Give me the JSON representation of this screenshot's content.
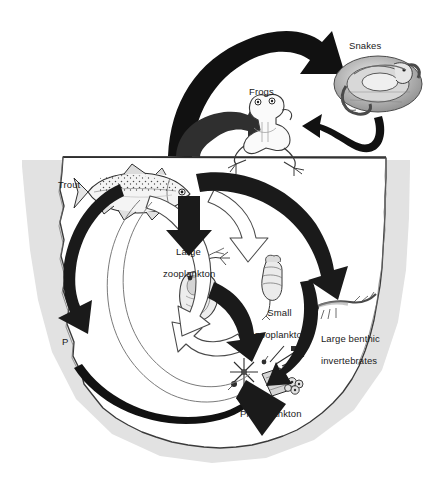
{
  "figure": {
    "type": "food-web-diagram",
    "background_color": "#ffffff",
    "ink_color": "#1a1a1a"
  },
  "regions": {
    "above_water": {
      "name": "terrestrial / above-water zone",
      "description": "open white area above the lake outline"
    },
    "water_body": {
      "name": "lake",
      "description": "irregular rounded basin with a straight waterline at the top",
      "fill": "#ffffff",
      "stroke": "#2b2b2b",
      "shadow": "#dcdcdc"
    }
  },
  "organisms": [
    {
      "id": "snakes",
      "label": "Snakes",
      "label_lines": [
        "Snakes"
      ],
      "zone": "above_water",
      "icon": "snake-coiled-icon",
      "x": 380,
      "y": 95,
      "label_x": 349,
      "label_y": 40
    },
    {
      "id": "frogs",
      "label": "Frogs",
      "label_lines": [
        "Frogs"
      ],
      "zone": "above_water",
      "icon": "frog-icon",
      "x": 268,
      "y": 117,
      "label_x": 249,
      "label_y": 86
    },
    {
      "id": "trout",
      "label": "Trout",
      "label_lines": [
        "Trout"
      ],
      "zone": "water_body",
      "icon": "trout-fish-icon",
      "x": 137,
      "y": 188,
      "label_x": 58,
      "label_y": 179
    },
    {
      "id": "large_zoo",
      "label": "Large zooplankton",
      "label_lines": [
        "Large",
        "zooplankton"
      ],
      "zone": "water_body",
      "icon": "daphnia-icon",
      "x": 196,
      "y": 288,
      "label_x": 182,
      "label_y": 235
    },
    {
      "id": "small_zoo",
      "label": "Small zooplankton",
      "label_lines": [
        "Small",
        "zooplankton"
      ],
      "zone": "water_body",
      "icon": "rotifer-icon",
      "x": 270,
      "y": 279,
      "label_x": 272,
      "label_y": 296
    },
    {
      "id": "benthic",
      "label": "Large benthic invertebrates",
      "label_lines": [
        "Large benthic",
        "invertebrates"
      ],
      "zone": "water_body",
      "icon": "benthic-larva-icon",
      "x": 334,
      "y": 306,
      "label_x": 313,
      "label_y": 322
    },
    {
      "id": "phytoplankton",
      "label": "Phytoplankton",
      "label_lines": [
        "Phytoplankton"
      ],
      "zone": "water_body",
      "icon": "phytoplankton-icon",
      "x": 268,
      "y": 383,
      "label_x": 240,
      "label_y": 408
    },
    {
      "id": "phosphorus",
      "label": "P",
      "label_lines": [
        "P"
      ],
      "zone": "water_body",
      "icon": "nutrient-label",
      "x": 66,
      "y": 340,
      "label_x": 63,
      "label_y": 336
    }
  ],
  "arrows": [
    {
      "id": "trout-to-snakes",
      "from": "trout",
      "to": "snakes",
      "style": "thick-black-curve",
      "color": "#111111"
    },
    {
      "id": "water-to-frogs",
      "from": "water_body",
      "to": "frogs",
      "style": "thick-dark-curve",
      "color": "#2e2e2e"
    },
    {
      "id": "snakes-to-frogs",
      "from": "snakes",
      "to": "frogs",
      "style": "medium-black-curve",
      "color": "#111111"
    },
    {
      "id": "trout-to-large-zoo",
      "from": "trout",
      "to": "large_zoo",
      "style": "thick-black-curve",
      "color": "#1a1a1a"
    },
    {
      "id": "trout-to-P",
      "from": "trout",
      "to": "phosphorus",
      "style": "thick-black-curve",
      "color": "#1a1a1a"
    },
    {
      "id": "trout-to-benthic",
      "from": "trout",
      "to": "benthic",
      "style": "thick-black-curve",
      "color": "#1a1a1a"
    },
    {
      "id": "large-zoo-to-phyto",
      "from": "large_zoo",
      "to": "phytoplankton",
      "style": "thick-black-curve",
      "color": "#1a1a1a"
    },
    {
      "id": "benthic-to-phyto",
      "from": "benthic",
      "to": "phytoplankton",
      "style": "medium-black-curve",
      "color": "#1a1a1a"
    },
    {
      "id": "P-to-phyto",
      "from": "phosphorus",
      "to": "phytoplankton",
      "style": "tapered-black-curve",
      "color": "#111111"
    },
    {
      "id": "phyto-to-large-zoo",
      "from": "phytoplankton",
      "to": "large_zoo",
      "style": "white-outline-curve",
      "color": "#ffffff"
    },
    {
      "id": "large-zoo-to-trout",
      "from": "large_zoo",
      "to": "trout",
      "style": "white-outline-curve",
      "color": "#ffffff"
    },
    {
      "id": "small-zoo-to-loop",
      "from": "small_zoo",
      "to": "large_zoo",
      "style": "white-outline-curve",
      "color": "#ffffff"
    },
    {
      "id": "inner-recycle-loop",
      "from": "phytoplankton",
      "to": "trout",
      "style": "thin-outline-loop",
      "color": "#6d6d6d"
    }
  ]
}
